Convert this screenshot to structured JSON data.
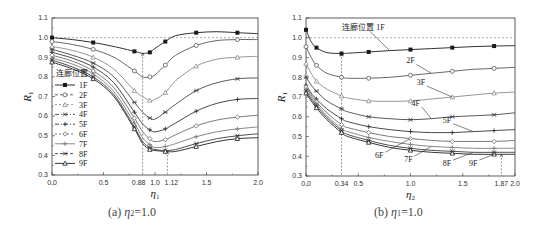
{
  "chart_data": [
    {
      "type": "line",
      "panel": "a",
      "caption": "(a) η2 = 1.0",
      "caption_prefix": "(a)",
      "caption_var": "η",
      "caption_sub": "2",
      "caption_eq": "=1.0",
      "xlabel": "η1",
      "ylabel": "R1",
      "xlim": [
        0.0,
        2.0
      ],
      "ylim": [
        0.3,
        1.1
      ],
      "xticks": [
        "0.0",
        "0.5",
        "1.0",
        "1.5",
        "2.0"
      ],
      "xtick_extra": [
        "0.88",
        "1.12"
      ],
      "yticks": [
        "0.3",
        "0.4",
        "0.5",
        "0.6",
        "0.7",
        "0.8",
        "0.9",
        "1.0",
        "1.1"
      ],
      "reference_line_y": 1.0,
      "annotations": [
        {
          "x": 0.88,
          "y": 0.92,
          "text": "0.88"
        },
        {
          "x": 1.12,
          "y": 0.42,
          "text": "1.12"
        }
      ],
      "legend_title": "连廊位置",
      "legend_position": "left-middle",
      "x": [
        0.0,
        0.2,
        0.4,
        0.6,
        0.8,
        0.88,
        0.95,
        1.0,
        1.1,
        1.2,
        1.4,
        1.6,
        1.8,
        2.0
      ],
      "series": [
        {
          "name": "1F",
          "values": [
            1.0,
            0.99,
            0.975,
            0.955,
            0.93,
            0.92,
            0.925,
            0.945,
            0.98,
            1.01,
            1.025,
            1.03,
            1.025,
            1.02
          ]
        },
        {
          "name": "2F",
          "values": [
            0.98,
            0.965,
            0.94,
            0.9,
            0.83,
            0.8,
            0.8,
            0.81,
            0.86,
            0.91,
            0.96,
            0.985,
            0.99,
            0.99
          ]
        },
        {
          "name": "3F",
          "values": [
            0.955,
            0.935,
            0.9,
            0.84,
            0.73,
            0.7,
            0.68,
            0.685,
            0.72,
            0.78,
            0.855,
            0.89,
            0.9,
            0.905
          ]
        },
        {
          "name": "4F",
          "values": [
            0.94,
            0.91,
            0.87,
            0.8,
            0.67,
            0.62,
            0.59,
            0.585,
            0.62,
            0.66,
            0.73,
            0.77,
            0.79,
            0.795
          ]
        },
        {
          "name": "5F",
          "values": [
            0.925,
            0.895,
            0.85,
            0.77,
            0.62,
            0.56,
            0.53,
            0.52,
            0.535,
            0.565,
            0.625,
            0.665,
            0.685,
            0.69
          ]
        },
        {
          "name": "6F",
          "values": [
            0.91,
            0.88,
            0.83,
            0.745,
            0.59,
            0.52,
            0.485,
            0.47,
            0.48,
            0.505,
            0.55,
            0.58,
            0.595,
            0.605
          ]
        },
        {
          "name": "7F",
          "values": [
            0.895,
            0.865,
            0.815,
            0.725,
            0.565,
            0.49,
            0.455,
            0.44,
            0.445,
            0.46,
            0.495,
            0.52,
            0.535,
            0.545
          ]
        },
        {
          "name": "8F",
          "values": [
            0.885,
            0.85,
            0.8,
            0.71,
            0.545,
            0.47,
            0.44,
            0.43,
            0.425,
            0.43,
            0.46,
            0.485,
            0.5,
            0.51
          ]
        },
        {
          "name": "9F",
          "values": [
            0.875,
            0.84,
            0.79,
            0.7,
            0.535,
            0.46,
            0.43,
            0.425,
            0.42,
            0.42,
            0.445,
            0.47,
            0.485,
            0.49
          ]
        }
      ]
    },
    {
      "type": "line",
      "panel": "b",
      "caption": "(b) η1 = 1.0",
      "caption_prefix": "(b)",
      "caption_var": "η",
      "caption_sub": "1",
      "caption_eq": "=1.0",
      "xlabel": "η2",
      "ylabel": "R1",
      "xlim": [
        0.0,
        2.0
      ],
      "ylim": [
        0.3,
        1.1
      ],
      "xticks": [
        "0.0",
        "0.5",
        "1.0",
        "1.5",
        "2.0"
      ],
      "xtick_extra": [
        "0.34",
        "1.87"
      ],
      "yticks": [
        "0.3",
        "0.4",
        "0.5",
        "0.6",
        "0.7",
        "0.8",
        "0.9",
        "1.0",
        "1.1"
      ],
      "reference_line_y": 1.0,
      "annotations": [
        {
          "x": 0.34,
          "y": 0.92,
          "text": "0.34"
        },
        {
          "x": 1.87,
          "y": 0.41,
          "text": "1.87"
        }
      ],
      "legend_title": "连廊位置",
      "x": [
        0.0,
        0.05,
        0.1,
        0.2,
        0.34,
        0.4,
        0.6,
        0.8,
        1.0,
        1.2,
        1.4,
        1.6,
        1.8,
        2.0
      ],
      "series": [
        {
          "name": "1F",
          "values": [
            1.04,
            0.98,
            0.95,
            0.925,
            0.92,
            0.922,
            0.928,
            0.935,
            0.94,
            0.945,
            0.95,
            0.955,
            0.958,
            0.96
          ]
        },
        {
          "name": "2F",
          "values": [
            0.955,
            0.9,
            0.86,
            0.82,
            0.8,
            0.795,
            0.795,
            0.8,
            0.81,
            0.82,
            0.83,
            0.84,
            0.845,
            0.85
          ]
        },
        {
          "name": "3F",
          "values": [
            0.87,
            0.82,
            0.78,
            0.74,
            0.705,
            0.695,
            0.68,
            0.678,
            0.68,
            0.69,
            0.7,
            0.71,
            0.72,
            0.725
          ]
        },
        {
          "name": "4F",
          "values": [
            0.8,
            0.76,
            0.73,
            0.68,
            0.64,
            0.625,
            0.6,
            0.59,
            0.585,
            0.59,
            0.6,
            0.605,
            0.61,
            0.62
          ]
        },
        {
          "name": "5F",
          "values": [
            0.76,
            0.72,
            0.69,
            0.64,
            0.59,
            0.575,
            0.55,
            0.535,
            0.525,
            0.52,
            0.52,
            0.525,
            0.53,
            0.535
          ]
        },
        {
          "name": "6F",
          "values": [
            0.75,
            0.71,
            0.675,
            0.62,
            0.56,
            0.545,
            0.52,
            0.5,
            0.49,
            0.48,
            0.475,
            0.475,
            0.475,
            0.48
          ]
        },
        {
          "name": "7F",
          "values": [
            0.74,
            0.7,
            0.665,
            0.605,
            0.54,
            0.525,
            0.495,
            0.475,
            0.46,
            0.45,
            0.445,
            0.44,
            0.44,
            0.44
          ]
        },
        {
          "name": "8F",
          "values": [
            0.73,
            0.69,
            0.655,
            0.595,
            0.53,
            0.51,
            0.48,
            0.455,
            0.44,
            0.43,
            0.425,
            0.42,
            0.42,
            0.42
          ]
        },
        {
          "name": "9F",
          "values": [
            0.72,
            0.68,
            0.645,
            0.585,
            0.52,
            0.5,
            0.47,
            0.445,
            0.43,
            0.42,
            0.415,
            0.41,
            0.41,
            0.41
          ]
        }
      ],
      "series_labels": [
        {
          "name": "连廊位置 1F",
          "x": 0.55,
          "y": 1.04
        },
        {
          "name": "2F",
          "x": 1.0,
          "y": 0.87
        },
        {
          "name": "3F",
          "x": 1.1,
          "y": 0.76
        },
        {
          "name": "4F",
          "x": 1.05,
          "y": 0.655
        },
        {
          "name": "5F",
          "x": 1.35,
          "y": 0.57
        },
        {
          "name": "6F",
          "x": 0.7,
          "y": 0.39
        },
        {
          "name": "7F",
          "x": 0.98,
          "y": 0.37
        },
        {
          "name": "8F",
          "x": 1.35,
          "y": 0.35
        },
        {
          "name": "9F",
          "x": 1.6,
          "y": 0.35
        }
      ]
    }
  ],
  "style": {
    "series_colors": [
      "#1a1a1a",
      "#555555",
      "#8a8a8a",
      "#444444",
      "#333333",
      "#6a6a6a",
      "#7a7a7a",
      "#3a3a3a",
      "#1f1f1f"
    ],
    "ref_line_color": "#777777",
    "axis_color": "#333333"
  }
}
